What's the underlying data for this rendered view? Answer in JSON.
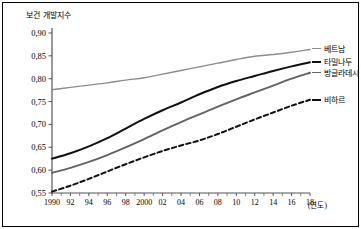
{
  "chart_data": {
    "type": "line",
    "title": "보건 개발지수",
    "xlabel": "(연도)",
    "ylabel": "",
    "xlim": [
      1990,
      2018
    ],
    "ylim": [
      0.55,
      0.9
    ],
    "ytick_step": 0.05,
    "grid": false,
    "legend_position": "right",
    "decimal_separator": ",",
    "x": [
      1990,
      1992,
      1994,
      1996,
      1998,
      2000,
      2002,
      2004,
      2006,
      2008,
      2010,
      2012,
      2014,
      2016,
      2018
    ],
    "xtick_labels": [
      "1990",
      "92",
      "94",
      "96",
      "98",
      "2000",
      "02",
      "04",
      "06",
      "08",
      "10",
      "12",
      "14",
      "16",
      "18"
    ],
    "ytick_labels": [
      "0,90",
      "0,85",
      "0,80",
      "0,75",
      "0,70",
      "0,65",
      "0,60",
      "0,55"
    ],
    "ytick_values": [
      0.9,
      0.85,
      0.8,
      0.75,
      0.7,
      0.65,
      0.6,
      0.55
    ],
    "series": [
      {
        "name": "베트남",
        "color": "#8c8c8c",
        "style": "solid",
        "width": 1.4,
        "values": [
          0.776,
          0.781,
          0.786,
          0.791,
          0.797,
          0.802,
          0.81,
          0.818,
          0.826,
          0.834,
          0.842,
          0.849,
          0.853,
          0.858,
          0.864
        ]
      },
      {
        "name": "타밀나두",
        "color": "#101010",
        "style": "solid",
        "width": 2.0,
        "values": [
          0.625,
          0.637,
          0.652,
          0.67,
          0.691,
          0.712,
          0.731,
          0.748,
          0.766,
          0.782,
          0.795,
          0.806,
          0.817,
          0.827,
          0.836
        ]
      },
      {
        "name": "방글라데시",
        "color": "#636363",
        "style": "solid",
        "width": 1.9,
        "values": [
          0.594,
          0.605,
          0.618,
          0.633,
          0.65,
          0.668,
          0.687,
          0.705,
          0.722,
          0.739,
          0.755,
          0.77,
          0.785,
          0.8,
          0.813
        ]
      },
      {
        "name": "비하르",
        "color": "#101010",
        "style": "dashed",
        "width": 2.0,
        "values": [
          0.553,
          0.566,
          0.581,
          0.597,
          0.613,
          0.628,
          0.642,
          0.654,
          0.665,
          0.679,
          0.695,
          0.711,
          0.726,
          0.741,
          0.754
        ]
      }
    ],
    "legend_entries": [
      {
        "label": "베트남",
        "color": "#8c8c8c",
        "style": "solid"
      },
      {
        "label": "타밀나두",
        "color": "#101010",
        "style": "solid"
      },
      {
        "label": "방글라데시",
        "color": "#636363",
        "style": "solid"
      },
      {
        "label": "비하르",
        "color": "#101010",
        "style": "dashed"
      }
    ]
  }
}
